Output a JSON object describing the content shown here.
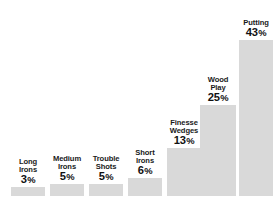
{
  "chart_data": {
    "type": "bar",
    "title": "",
    "xlabel": "",
    "ylabel": "",
    "grid": false,
    "legend": false,
    "unit": "%",
    "orientation": "vertical",
    "bar_color": "#d9d9d9",
    "text_color": "#1a1a1a",
    "background": "#ffffff",
    "categories": [
      "Long Irons",
      "Medium Irons",
      "Trouble Shots",
      "Short Irons",
      "Finesse Wedges",
      "Wood Play",
      "Putting"
    ],
    "values": [
      3,
      5,
      5,
      6,
      13,
      25,
      43
    ],
    "ylim": [
      0,
      43
    ],
    "bars": [
      {
        "category": "Long Irons",
        "value": 3,
        "value_label": "3",
        "pct_symbol": "%",
        "name_lines": [
          "Long",
          "Irons"
        ],
        "left": 11,
        "width": 34,
        "bar_height": 9
      },
      {
        "category": "Medium Irons",
        "value": 5,
        "value_label": "5",
        "pct_symbol": "%",
        "name_lines": [
          "Medium",
          "Irons"
        ],
        "left": 50,
        "width": 34,
        "bar_height": 12
      },
      {
        "category": "Trouble Shots",
        "value": 5,
        "value_label": "5",
        "pct_symbol": "%",
        "name_lines": [
          "Trouble",
          "Shots"
        ],
        "left": 89,
        "width": 34,
        "bar_height": 12
      },
      {
        "category": "Short Irons",
        "value": 6,
        "value_label": "6",
        "pct_symbol": "%",
        "name_lines": [
          "Short",
          "Irons"
        ],
        "left": 128,
        "width": 34,
        "bar_height": 18
      },
      {
        "category": "Finesse Wedges",
        "value": 13,
        "value_label": "13",
        "pct_symbol": "%",
        "name_lines": [
          "Finesse",
          "Wedges"
        ],
        "left": 167,
        "width": 34,
        "bar_height": 48
      },
      {
        "category": "Wood Play",
        "value": 25,
        "value_label": "25",
        "pct_symbol": "%",
        "name_lines": [
          "Wood",
          "Play"
        ],
        "left": 200,
        "width": 36,
        "bar_height": 91
      },
      {
        "category": "Putting",
        "value": 43,
        "value_label": "43",
        "pct_symbol": "%",
        "name_lines": [
          "Putting"
        ],
        "left": 239,
        "width": 34,
        "bar_height": 156
      }
    ]
  }
}
